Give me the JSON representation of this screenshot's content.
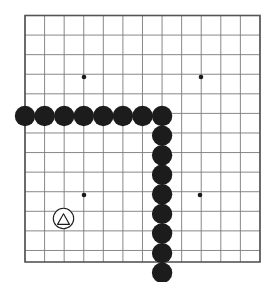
{
  "board": {
    "kind": "go-board-diagram",
    "background_color": "#ffffff",
    "grid": {
      "line_color": "#7a7a7a",
      "line_width": 0.9,
      "border_color": "#555555",
      "border_width": 1.6,
      "origin_x": 25,
      "origin_y": 15.5,
      "spacing": 19.58,
      "columns": 13,
      "rows": 14,
      "left": 25,
      "top": 15.5,
      "right": 260,
      "bottom": 262
    },
    "star_points": {
      "color": "#1a1a1a",
      "radius": 2.3,
      "points": [
        {
          "name": "star-top-left",
          "x": 84,
          "y": 77
        },
        {
          "name": "star-top-right",
          "x": 201,
          "y": 77
        },
        {
          "name": "star-bottom-left",
          "x": 84,
          "y": 195
        },
        {
          "name": "star-bottom-right",
          "x": 200,
          "y": 195
        }
      ]
    },
    "stones": {
      "black_color": "#1c1c1c",
      "white_color": "#ffffff",
      "white_outline_color": "#1c1c1c",
      "radius": 10.2,
      "black": [
        {
          "name": "black-stone-row-1",
          "x": 25,
          "y": 116
        },
        {
          "name": "black-stone-row-2",
          "x": 44.6,
          "y": 116
        },
        {
          "name": "black-stone-row-3",
          "x": 64.2,
          "y": 116
        },
        {
          "name": "black-stone-row-4",
          "x": 83.8,
          "y": 116
        },
        {
          "name": "black-stone-row-5",
          "x": 103.3,
          "y": 116
        },
        {
          "name": "black-stone-row-6",
          "x": 122.9,
          "y": 116
        },
        {
          "name": "black-stone-row-7",
          "x": 142.5,
          "y": 116
        },
        {
          "name": "black-stone-corner",
          "x": 162.1,
          "y": 116
        },
        {
          "name": "black-stone-col-2",
          "x": 162.1,
          "y": 135.6
        },
        {
          "name": "black-stone-col-3",
          "x": 162.1,
          "y": 155.2
        },
        {
          "name": "black-stone-col-4",
          "x": 162.1,
          "y": 174.8
        },
        {
          "name": "black-stone-col-5",
          "x": 162.1,
          "y": 194.3
        },
        {
          "name": "black-stone-col-6",
          "x": 162.1,
          "y": 213.9
        },
        {
          "name": "black-stone-col-7",
          "x": 162.1,
          "y": 233.5
        },
        {
          "name": "black-stone-col-8",
          "x": 162.1,
          "y": 253.1
        },
        {
          "name": "black-stone-col-9",
          "x": 162.1,
          "y": 272.7
        }
      ],
      "marked": [
        {
          "name": "white-stone-triangle-marked",
          "x": 63.5,
          "y": 218.5,
          "radius": 10.2,
          "marker": "triangle",
          "marker_color": "#1c1c1c",
          "marker_size": 11.5
        }
      ]
    }
  },
  "legend": {
    "black_stone_label": "black stone",
    "marked_stone_label": "marked stone (triangle)",
    "star_point_label": "star point (hoshi)"
  }
}
